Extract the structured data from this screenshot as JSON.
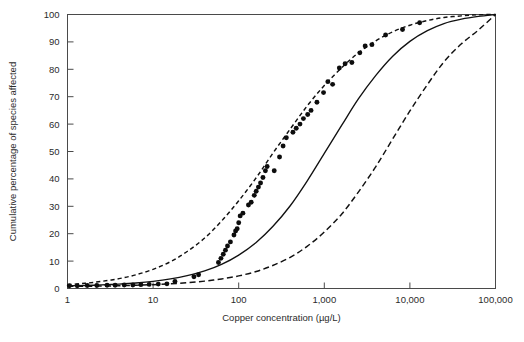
{
  "chart_data": {
    "type": "line",
    "title": "",
    "xlabel": "Copper concentration (µg/L)",
    "ylabel": "Cumulative percentage of species affected",
    "xscale": "log",
    "xlim": [
      1,
      100000
    ],
    "ylim": [
      0,
      100
    ],
    "xticks": [
      1,
      10,
      100,
      1000,
      10000,
      100000
    ],
    "xtick_labels": [
      "1",
      "10",
      "100",
      "1,000",
      "10,000",
      "100,000"
    ],
    "yticks": [
      0,
      10,
      20,
      30,
      40,
      50,
      60,
      70,
      80,
      90,
      100
    ],
    "ytick_labels": [
      "0",
      "10",
      "20",
      "30",
      "40",
      "50",
      "60",
      "70",
      "80",
      "90",
      "100"
    ],
    "grid": false,
    "legend": "none",
    "series": [
      {
        "name": "Fitted species sensitivity distribution",
        "style": "solid",
        "color": "#111111",
        "points": [
          [
            1,
            1.0
          ],
          [
            1.6,
            1.1
          ],
          [
            2.5,
            1.3
          ],
          [
            4,
            1.6
          ],
          [
            6.3,
            2.0
          ],
          [
            10,
            2.6
          ],
          [
            16,
            3.5
          ],
          [
            25,
            4.7
          ],
          [
            40,
            6.4
          ],
          [
            63,
            8.8
          ],
          [
            100,
            12.2
          ],
          [
            160,
            16.8
          ],
          [
            250,
            22.6
          ],
          [
            400,
            30.2
          ],
          [
            630,
            39.2
          ],
          [
            1000,
            49.3
          ],
          [
            1600,
            59.6
          ],
          [
            2500,
            69.2
          ],
          [
            4000,
            77.8
          ],
          [
            6300,
            84.8
          ],
          [
            10000,
            90.2
          ],
          [
            16000,
            94.1
          ],
          [
            25000,
            96.7
          ],
          [
            40000,
            98.3
          ],
          [
            63000,
            99.3
          ],
          [
            100000,
            100.0
          ]
        ]
      },
      {
        "name": "Upper 95% confidence bound",
        "style": "dashed-short",
        "color": "#111111",
        "points": [
          [
            1,
            1.4
          ],
          [
            1.6,
            1.9
          ],
          [
            2.5,
            2.6
          ],
          [
            4,
            3.6
          ],
          [
            6.3,
            5.0
          ],
          [
            10,
            7.0
          ],
          [
            16,
            9.8
          ],
          [
            25,
            13.5
          ],
          [
            40,
            18.4
          ],
          [
            63,
            24.6
          ],
          [
            100,
            32.0
          ],
          [
            160,
            40.4
          ],
          [
            250,
            49.3
          ],
          [
            400,
            58.2
          ],
          [
            630,
            66.6
          ],
          [
            1000,
            74.1
          ],
          [
            1600,
            80.6
          ],
          [
            2500,
            86.0
          ],
          [
            4000,
            90.4
          ],
          [
            6300,
            93.7
          ],
          [
            10000,
            96.1
          ],
          [
            16000,
            97.8
          ],
          [
            25000,
            98.9
          ],
          [
            40000,
            99.5
          ],
          [
            63000,
            99.9
          ],
          [
            100000,
            100.0
          ]
        ]
      },
      {
        "name": "Lower 95% confidence bound",
        "style": "dashed-long",
        "color": "#111111",
        "points": [
          [
            1,
            0.8
          ],
          [
            1.6,
            0.8
          ],
          [
            2.5,
            0.9
          ],
          [
            4,
            1.0
          ],
          [
            6.3,
            1.2
          ],
          [
            10,
            1.4
          ],
          [
            16,
            1.7
          ],
          [
            25,
            2.1
          ],
          [
            40,
            2.7
          ],
          [
            63,
            3.5
          ],
          [
            100,
            4.6
          ],
          [
            160,
            6.2
          ],
          [
            250,
            8.4
          ],
          [
            400,
            11.4
          ],
          [
            630,
            15.4
          ],
          [
            1000,
            20.6
          ],
          [
            1600,
            27.2
          ],
          [
            2500,
            35.2
          ],
          [
            4000,
            44.5
          ],
          [
            6300,
            54.6
          ],
          [
            10000,
            64.8
          ],
          [
            16000,
            74.4
          ],
          [
            25000,
            82.7
          ],
          [
            40000,
            89.3
          ],
          [
            63000,
            94.3
          ],
          [
            100000,
            100.0
          ]
        ]
      }
    ],
    "scatter": {
      "name": "Observed species toxicity values",
      "marker": "filled-circle",
      "color": "#0d0d0d",
      "points": [
        [
          1.05,
          1.0
        ],
        [
          1.3,
          1.0
        ],
        [
          1.7,
          1.1
        ],
        [
          2.2,
          1.1
        ],
        [
          2.9,
          1.2
        ],
        [
          3.6,
          1.2
        ],
        [
          4.6,
          1.3
        ],
        [
          5.8,
          1.3
        ],
        [
          7.2,
          1.4
        ],
        [
          9.0,
          1.5
        ],
        [
          11.5,
          1.6
        ],
        [
          14.5,
          1.7
        ],
        [
          18.0,
          2.6
        ],
        [
          30.0,
          4.3
        ],
        [
          34.0,
          5.0
        ],
        [
          58.0,
          9.5
        ],
        [
          62.0,
          11.0
        ],
        [
          66.0,
          12.5
        ],
        [
          70.0,
          14.0
        ],
        [
          74.0,
          15.5
        ],
        [
          80.0,
          17.0
        ],
        [
          88.0,
          19.5
        ],
        [
          92.0,
          21.0
        ],
        [
          96.0,
          21.8
        ],
        [
          100.0,
          24.0
        ],
        [
          104.0,
          26.5
        ],
        [
          112.0,
          27.5
        ],
        [
          130.0,
          30.5
        ],
        [
          140.0,
          31.5
        ],
        [
          152.0,
          34.0
        ],
        [
          160.0,
          35.5
        ],
        [
          170.0,
          37.0
        ],
        [
          180.0,
          38.5
        ],
        [
          192.0,
          40.5
        ],
        [
          205.0,
          43.0
        ],
        [
          215.0,
          44.5
        ],
        [
          260.0,
          43.0
        ],
        [
          300.0,
          48.0
        ],
        [
          330.0,
          52.0
        ],
        [
          360.0,
          55.0
        ],
        [
          430.0,
          57.0
        ],
        [
          470.0,
          58.5
        ],
        [
          520.0,
          60.0
        ],
        [
          570.0,
          62.0
        ],
        [
          640.0,
          63.5
        ],
        [
          700.0,
          65.0
        ],
        [
          820.0,
          68.0
        ],
        [
          980.0,
          71.5
        ],
        [
          1100.0,
          75.5
        ],
        [
          1250.0,
          74.5
        ],
        [
          1500.0,
          80.5
        ],
        [
          1750.0,
          82.0
        ],
        [
          2100.0,
          82.5
        ],
        [
          2600.0,
          86.0
        ],
        [
          3000.0,
          88.5
        ],
        [
          3600.0,
          89.0
        ],
        [
          5200.0,
          92.5
        ],
        [
          8200.0,
          94.5
        ],
        [
          13000.0,
          97.0
        ]
      ]
    }
  },
  "figure": {
    "caption": ""
  }
}
